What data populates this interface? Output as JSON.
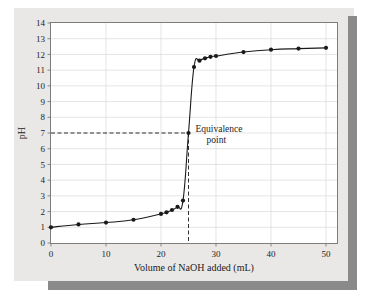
{
  "chart_data": {
    "type": "line",
    "title": "",
    "xlabel": "Volume of NaOH added (mL)",
    "ylabel": "pH",
    "xlim": [
      0,
      52
    ],
    "ylim": [
      0,
      14
    ],
    "grid": true,
    "legend": null,
    "xticks": [
      0,
      10,
      20,
      30,
      40,
      50
    ],
    "xtick_labels": [
      "0",
      "10",
      "20",
      "30",
      "40",
      "50"
    ],
    "yticks": [
      0,
      1,
      2,
      3,
      4,
      5,
      6,
      7,
      8,
      9,
      10,
      11,
      12,
      13,
      14
    ],
    "ytick_labels": [
      "0",
      "1",
      "2",
      "3",
      "4",
      "5",
      "6",
      "7",
      "8",
      "9",
      "10",
      "11",
      "12",
      "13",
      "14"
    ],
    "series": [
      {
        "name": "titration-curve",
        "marker": "filled-circle",
        "color": "#1a1a1a",
        "x": [
          0,
          5,
          10,
          15,
          20,
          21,
          22,
          23,
          24,
          25,
          26,
          27,
          28,
          29,
          30,
          35,
          40,
          45,
          50
        ],
        "y": [
          1.0,
          1.18,
          1.3,
          1.48,
          1.85,
          1.95,
          2.1,
          2.3,
          2.7,
          7.0,
          11.2,
          11.6,
          11.75,
          11.85,
          11.9,
          12.15,
          12.3,
          12.37,
          12.42
        ]
      }
    ],
    "annotations": [
      {
        "name": "equivalence-point",
        "label_line1": "Equivalence",
        "label_line2": "point",
        "x": 25,
        "y": 7.0,
        "guide_horizontal_from_x": 0,
        "guide_vertical_to_y": 0,
        "style": "dashed"
      }
    ]
  },
  "colors": {
    "curve": "#1a1a1a",
    "grid": "#d8d8d8",
    "axis": "#7d7d7d",
    "card_background": "#e9e8e6",
    "plot_background": "#ffffff",
    "shadow": "#8a8a8a",
    "text": "#1c1c1c"
  }
}
